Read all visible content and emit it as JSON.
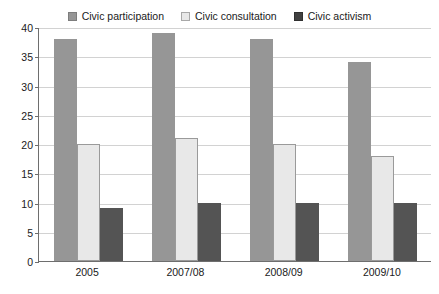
{
  "chart_data": {
    "type": "bar",
    "title": "",
    "subtitle": "",
    "xlabel": "",
    "ylabel": "",
    "categories": [
      "2005",
      "2007/08",
      "2008/09",
      "2009/10"
    ],
    "series": [
      {
        "name": "Civic participation",
        "values": [
          38,
          39,
          38,
          34
        ],
        "color": "#969696"
      },
      {
        "name": "Civic consultation",
        "values": [
          20,
          21,
          20,
          18
        ],
        "color": "#e8e8e8"
      },
      {
        "name": "Civic activism",
        "values": [
          9,
          10,
          10,
          10
        ],
        "color": "#545454"
      }
    ],
    "ylim": [
      0,
      40
    ],
    "yticks": [
      0,
      5,
      10,
      15,
      20,
      25,
      30,
      35,
      40
    ],
    "ytick_labels": [
      "0",
      "5",
      "10",
      "15",
      "20",
      "25",
      "30",
      "35",
      "40"
    ],
    "grid": true,
    "grid_axis": "y",
    "legend_position": "top-center",
    "bar_grouping": "grouped"
  },
  "legend": {
    "entries": [
      {
        "label": "Civic participation",
        "swatch_color": "#969696",
        "swatch_border": "#7d7d7d"
      },
      {
        "label": "Civic consultation",
        "swatch_color": "#e8e8e8",
        "swatch_border": "#a8a8a8"
      },
      {
        "label": "Civic activism",
        "swatch_color": "#404040",
        "swatch_border": "#303030"
      }
    ]
  },
  "axes": {
    "axis_color": "#6e6e6e",
    "grid_color": "#d2d2d2",
    "text_color": "#1a1a1a"
  }
}
